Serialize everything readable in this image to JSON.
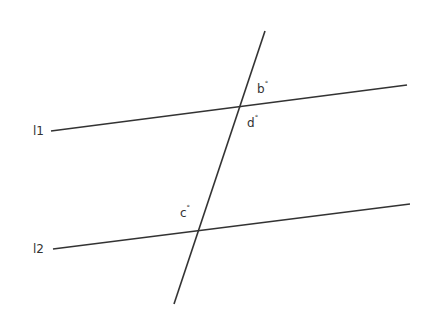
{
  "diagram": {
    "type": "parallel-lines-transversal",
    "background": "#ffffff",
    "line_color": "#333333",
    "lines": [
      {
        "id": "l1",
        "label": "l1",
        "x1": 51,
        "y1": 131,
        "x2": 407,
        "y2": 85
      },
      {
        "id": "l2",
        "label": "l2",
        "x1": 53,
        "y1": 249,
        "x2": 410,
        "y2": 204
      },
      {
        "id": "transversal",
        "label": "",
        "x1": 265,
        "y1": 31,
        "x2": 174,
        "y2": 304
      }
    ],
    "line_labels": {
      "l1": "l1",
      "l2": "l2"
    },
    "angle_labels": {
      "b": {
        "letter": "b",
        "mark": "°"
      },
      "d": {
        "letter": "d",
        "mark": "°"
      },
      "c": {
        "letter": "c",
        "mark": "°"
      }
    }
  }
}
